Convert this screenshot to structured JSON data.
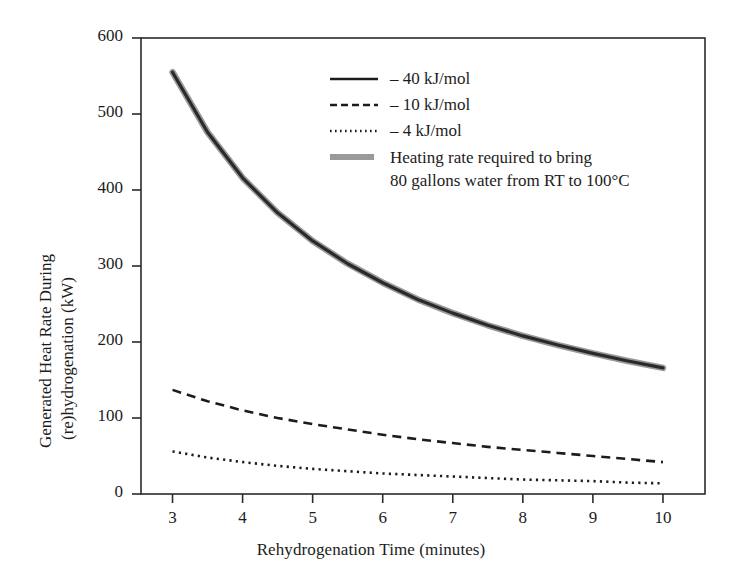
{
  "chart_data": {
    "type": "line",
    "title": "",
    "xlabel": "Rehydrogenation Time (minutes)",
    "ylabel_line1": "Generated Heat Rate During",
    "ylabel_line2": "(re)hydrogenation (kW)",
    "xlim": [
      2.55,
      10.6
    ],
    "ylim": [
      0,
      600
    ],
    "xticks": [
      3,
      4,
      5,
      6,
      7,
      8,
      9,
      10
    ],
    "yticks": [
      0,
      100,
      200,
      300,
      400,
      500,
      600
    ],
    "xtick_labels": [
      "3",
      "4",
      "5",
      "6",
      "7",
      "8",
      "9",
      "10"
    ],
    "ytick_labels": [
      "0",
      "100",
      "200",
      "300",
      "400",
      "500",
      "600"
    ],
    "grid": false,
    "legend_position": "upper-right-inside",
    "x": [
      3,
      3.5,
      4,
      4.5,
      5,
      5.5,
      6,
      6.5,
      7,
      7.5,
      8,
      8.5,
      9,
      9.5,
      10
    ],
    "series": [
      {
        "name": "- 40 kJ/mol",
        "style": "solid",
        "color": "#2a2a2a",
        "width": 3.2,
        "values": [
          555,
          476,
          416,
          370,
          333,
          303,
          278,
          256,
          238,
          222,
          208,
          196,
          185,
          175,
          166
        ]
      },
      {
        "name": "- 10 kJ/mol",
        "style": "dashed",
        "color": "#1c1c1c",
        "width": 2.6,
        "values": [
          137,
          122,
          110,
          100,
          92,
          85,
          78,
          72,
          67,
          62,
          58,
          54,
          50,
          46,
          42
        ]
      },
      {
        "name": "- 4 kJ/mol",
        "style": "dotted",
        "color": "#1c1c1c",
        "width": 2.6,
        "values": [
          56,
          48,
          42,
          37,
          33,
          30,
          27,
          25,
          23,
          21,
          19,
          18,
          17,
          15,
          14
        ]
      },
      {
        "name": "Heating rate required to bring 80 gallons water from RT to 100°C",
        "style": "thick-gray",
        "color": "#9a9a9a",
        "width": 6.5,
        "values": [
          555,
          476,
          416,
          370,
          333,
          303,
          278,
          256,
          238,
          222,
          208,
          196,
          185,
          175,
          166
        ]
      }
    ]
  },
  "legend": {
    "entries": [
      {
        "label": "– 40 kJ/mol",
        "swatch": "solid-line-swatch"
      },
      {
        "label": "– 10 kJ/mol",
        "swatch": "dashed-line-swatch"
      },
      {
        "label": "– 4 kJ/mol",
        "swatch": "dotted-line-swatch"
      },
      {
        "label_line1": "Heating rate required to bring",
        "label_line2": "80 gallons water from RT to 100°C",
        "swatch": "thick-gray-line-swatch"
      }
    ]
  },
  "colors": {
    "background": "#ffffff",
    "frame": "#2b2b2b",
    "text": "#1c1c1c",
    "curve_main": "#2a2a2a",
    "curve_gray": "#9a9a9a"
  }
}
